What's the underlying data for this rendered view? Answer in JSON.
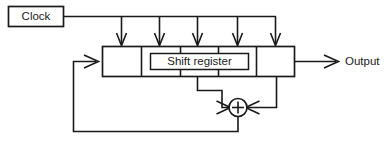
{
  "diagram": {
    "type": "block-diagram",
    "canvas": {
      "width": 392,
      "height": 150
    },
    "colors": {
      "line": "#1a1a1a",
      "background": "#ffffff",
      "fill": "#ffffff"
    },
    "clock_box": {
      "label": "Clock",
      "x": 8,
      "y": 6,
      "width": 55,
      "height": 20
    },
    "register": {
      "label": "Shift register",
      "x": 102,
      "y": 46,
      "width": 192,
      "height": 30,
      "cell_count": 5,
      "divider_x": [
        141,
        180,
        218,
        256
      ]
    },
    "shift_register_inner_box": {
      "x": 150,
      "y": 53,
      "width": 98,
      "height": 16
    },
    "clock_bus": {
      "y": 16,
      "from_x": 63,
      "to_x": 276,
      "arrow_x": [
        121,
        159,
        197,
        237,
        275
      ],
      "arrow_tip_y": 45,
      "arrow_count": 5
    },
    "output": {
      "label": "Output",
      "arrow_from_x": 294,
      "arrow_to_x": 338,
      "y": 61,
      "text_x": 345
    },
    "xor": {
      "symbol": "+",
      "center_x": 238,
      "center_y": 108,
      "radius": 9
    },
    "taps": {
      "left_tap_x": 197,
      "right_tap_x": 276,
      "tap_bus_y": 90,
      "tap_from_y": 76
    },
    "feedback": {
      "bottom_y": 131,
      "left_x": 73,
      "enters_register_y": 61,
      "from_xor_x": 238
    }
  },
  "labels": {
    "clock": "Clock",
    "shift_register": "Shift register",
    "output": "Output",
    "xor_symbol": "+"
  }
}
